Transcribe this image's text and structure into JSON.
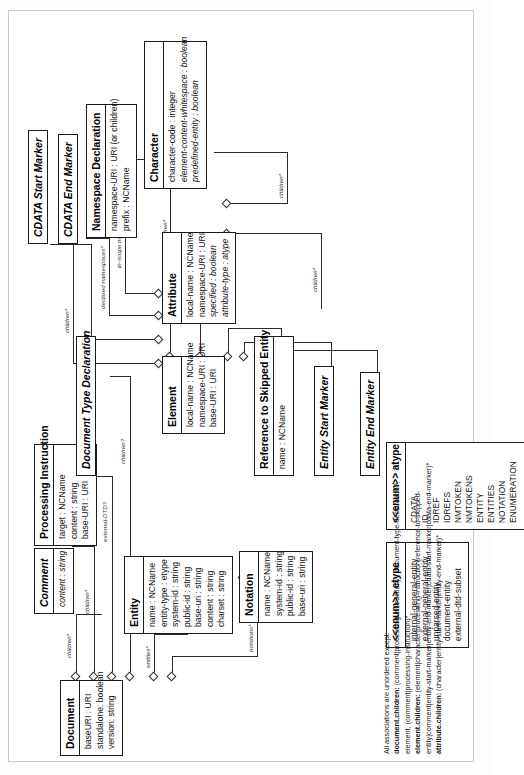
{
  "diagram": {
    "classes": [
      {
        "id": "cdata-start",
        "name": "CDATA Start Marker",
        "abstract": true,
        "attributes": []
      },
      {
        "id": "cdata-end",
        "name": "CDATA End Marker",
        "abstract": true,
        "attributes": []
      },
      {
        "id": "namespace-declaration",
        "name": "Namespace Declaration",
        "abstract": false,
        "attributes": [
          "namespace-URI : URI (or children)",
          "prefix : NCName"
        ]
      },
      {
        "id": "character",
        "name": "Character",
        "abstract": false,
        "attributes": [
          "character-code : integer",
          "element-content-whitespace : boolean",
          "predefined-entity : boolean"
        ]
      },
      {
        "id": "element",
        "name": "Element",
        "abstract": false,
        "attributes": [
          "local-name : NCName",
          "namespace-URI : URI",
          "base-URI : URI"
        ]
      },
      {
        "id": "attribute",
        "name": "Attribute",
        "abstract": false,
        "attributes": [
          "local-name : NCName",
          "namespace-URI : URI",
          "specified : boolean",
          "attribute-type : atype"
        ]
      },
      {
        "id": "processing-instruction",
        "name": "Processing Instruction",
        "abstract": false,
        "attributes": [
          "target : NCName",
          "content : string",
          "base-URI : URI"
        ]
      },
      {
        "id": "comment",
        "name": "Comment",
        "abstract": true,
        "attributes": [
          "content : string"
        ]
      },
      {
        "id": "document-type-declaration",
        "name": "Document Type Declaration",
        "abstract": true,
        "attributes": []
      },
      {
        "id": "reference-to-skipped-entity",
        "name": "Reference to Skipped Entity",
        "abstract": false,
        "attributes": [
          "name : NCName"
        ]
      },
      {
        "id": "entity-start-marker",
        "name": "Entity Start Marker",
        "abstract": true,
        "attributes": []
      },
      {
        "id": "entity-end-marker",
        "name": "Entity End Marker",
        "abstract": true,
        "attributes": []
      },
      {
        "id": "document",
        "name": "Document",
        "abstract": false,
        "attributes": [
          "baseURI : URI",
          "standalone: boolean",
          "version: string"
        ]
      },
      {
        "id": "notation",
        "name": "Notation",
        "abstract": false,
        "attributes": [
          "name : NCName",
          "system-id : string",
          "public-id : string",
          "base-uri : string"
        ]
      },
      {
        "id": "entity",
        "name": "Entity",
        "abstract": false,
        "attributes": [
          "name : NCName",
          "entity-type : etype",
          "system-id : string",
          "public-id : string",
          "base-uri : string",
          "content : string",
          "charset : string"
        ]
      },
      {
        "id": "enum-etype",
        "name": "<<enum>> etype",
        "abstract": false,
        "attributes": [
          "internal-general-entity",
          "external-general-entity",
          "unparsed-entity",
          "document-entity",
          "external-dtd-subset"
        ]
      },
      {
        "id": "enum-atype",
        "name": "<<enum>> atype",
        "abstract": false,
        "attributes": [
          "CDATA",
          "ID",
          "IDREF",
          "IDREFS",
          "NMTOKEN",
          "NMTOKENS",
          "ENTITY",
          "ENTITIES",
          "NOTATION",
          "ENUMERATION"
        ]
      }
    ],
    "roles": {
      "children_star": "children*",
      "children_q": "children?",
      "children_default": "children*/ default*",
      "attributes_star": "attributes*",
      "declared_namespaces": "declared namespaces*",
      "in_scope_namespaces": "in-scope namespaces*",
      "external_dtd": "external-DTD?",
      "entities_star": "entities*",
      "notations_star": "notations*",
      "notation_q": "notation?",
      "referent": "referent",
      "entity": "entity"
    },
    "footnote": {
      "intro": "All associations are unordered except:",
      "lines": [
        {
          "label": "document.children:",
          "text": " (comment|processing-instruction)*, document-type-declaration?, element, (comment|processing-instruction)*"
        },
        {
          "label": "element.children:",
          "text": " (element|character|processing-instruction|reference-to-skipped-entity|comment|entity-start-marker|entity-end-marker|cdata-start-marker|cdata-end-marker)*"
        },
        {
          "label": "attribute.children:",
          "text": " (character|entity-start-marker|entity-end-marker)*"
        }
      ]
    }
  }
}
